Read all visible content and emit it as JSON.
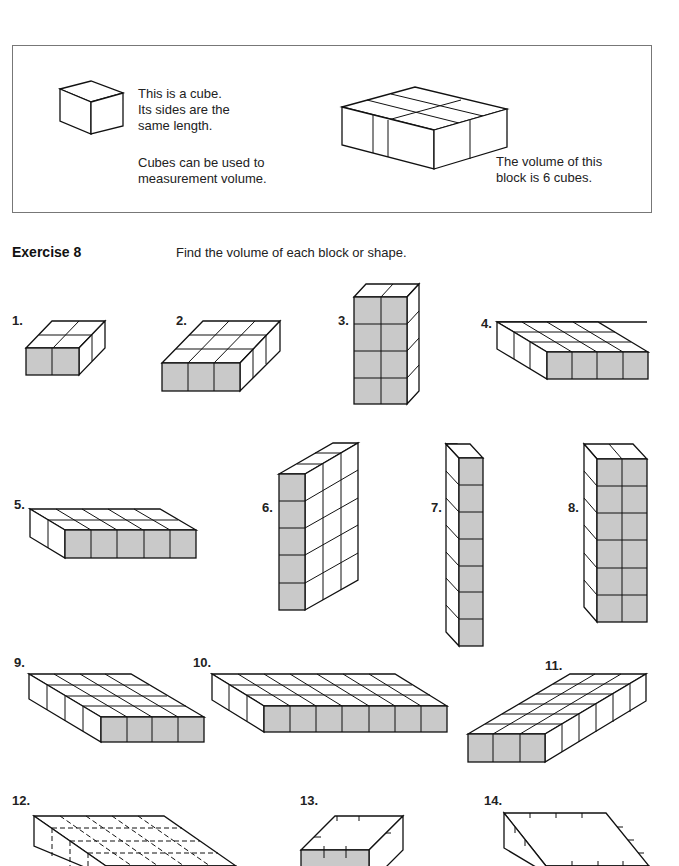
{
  "intro": {
    "cube_text_line1": "This is a cube.",
    "cube_text_line2": "Its sides are the",
    "cube_text_line3": "same length.",
    "cube_use_line1": "Cubes can be used to",
    "cube_use_line2": "measurement volume.",
    "block_text_line1": "The volume of this",
    "block_text_line2": "block is 6 cubes."
  },
  "exercise": {
    "title": "Exercise 8",
    "instruction": "Find the volume of each block or shape."
  },
  "problems": [
    {
      "label": "1."
    },
    {
      "label": "2."
    },
    {
      "label": "3."
    },
    {
      "label": "4."
    },
    {
      "label": "5."
    },
    {
      "label": "6."
    },
    {
      "label": "7."
    },
    {
      "label": "8."
    },
    {
      "label": "9."
    },
    {
      "label": "10."
    },
    {
      "label": "11."
    },
    {
      "label": "12."
    },
    {
      "label": "13."
    },
    {
      "label": "14."
    }
  ],
  "colors": {
    "front_face_shade": "#c9c9c9",
    "border": "#777777"
  }
}
